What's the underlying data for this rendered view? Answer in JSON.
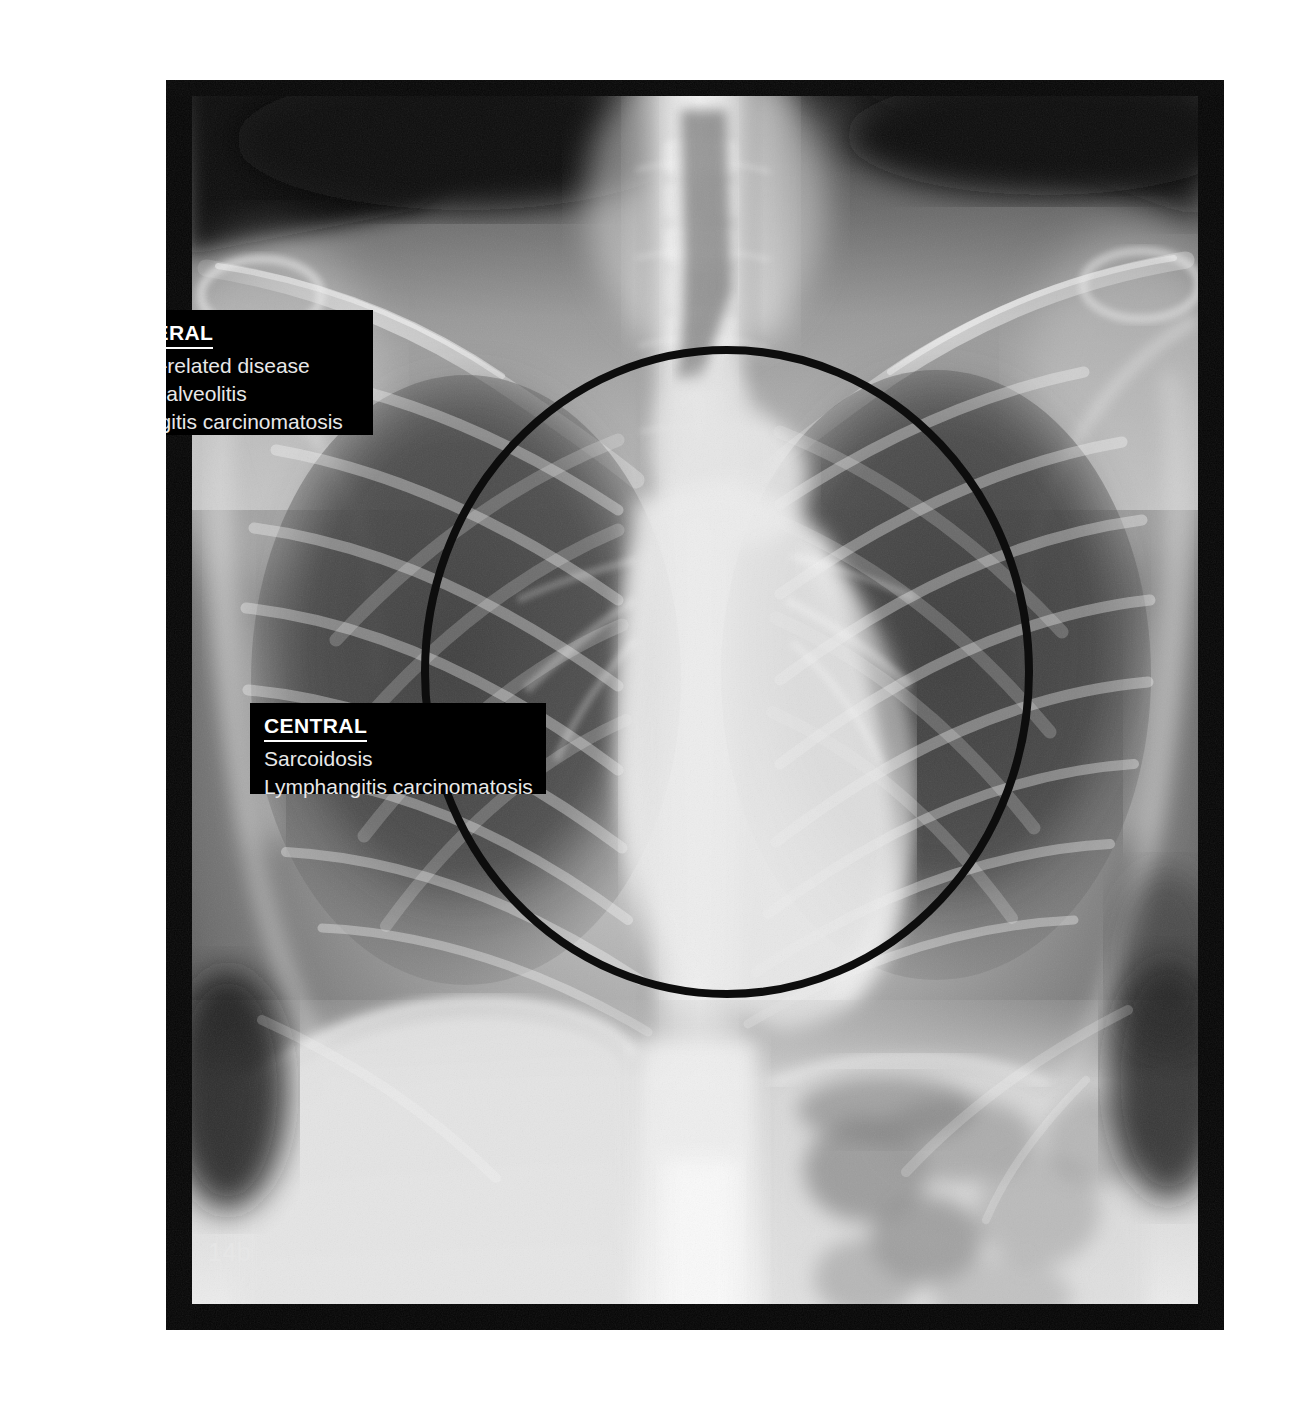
{
  "figure": {
    "number": "14b",
    "image_kind": "chest-radiograph-pa"
  },
  "annotations": {
    "region_of_interest": {
      "shape": "ellipse",
      "name": "central-zone-ellipse"
    },
    "labels": [
      {
        "id": "peripheral",
        "heading": "PERIPHERAL",
        "items": [
          "Asbestos-related disease",
          "Fibrosing alveolitis",
          "Lymphangitis carcinomatosis"
        ]
      },
      {
        "id": "central",
        "heading": "CENTRAL",
        "items": [
          "Sarcoidosis",
          "Lymphangitis carcinomatosis"
        ]
      }
    ]
  },
  "colors": {
    "label_background": "#000000",
    "label_text": "#ffffff",
    "label_item_text": "#e8e8e8",
    "plate_background": "#0a0a0a",
    "page_background": "#ffffff",
    "ellipse_stroke": "#111111"
  }
}
